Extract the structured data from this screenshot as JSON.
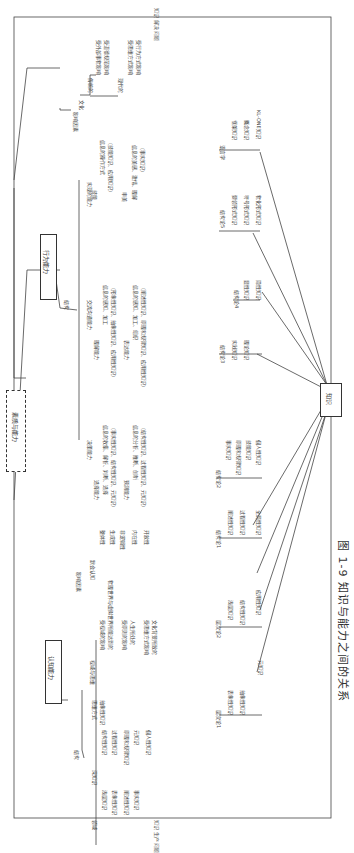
{
  "caption": "图 1-9  知识与能力之间的关系",
  "center_box": "素质与能力",
  "knowledge_box": "知识",
  "side_labels": {
    "top": "知识 解决 问题",
    "bottom": "知识 生产 问题"
  },
  "behavior": {
    "title": "行为能力",
    "structure": "结构",
    "influence": "影响因素",
    "culture": "文化",
    "traditional": "传统的",
    "trad_items": [
      "受外部事物影响",
      "受道德规范影响"
    ],
    "modern": "现代的",
    "modern_items": [
      "受思维方式影响",
      "受行为方式影响"
    ],
    "realize": "实现的能力",
    "skill": "技能",
    "skill_item": [
      "信息的操作方式",
      "（技能知识、应用知识）"
    ],
    "art": "审美",
    "art_item": [
      "信息的美感、激情、理解",
      "（事实知识）"
    ],
    "communicate": "交流沟通能力",
    "understand": "理解能力",
    "understand_item": [
      "信息的感知、加工",
      "（形象性知识、抽象性知识、应用性知识）"
    ],
    "express": "表达能力",
    "express_item": [
      "信息的感知、加工、组织",
      "（阐述性知识、原理和规律知识、应用性知识）"
    ],
    "decide": "决策能力",
    "choose": "选择能力",
    "choose_item": [
      "信息的收集、解析、判断、选择",
      "（事实性知识、结构性知识、元知识）"
    ],
    "predict": "预测能力",
    "predict_item": [
      "信息的分析、推断、创新",
      "（结构性知识、过程性知识、元知识）"
    ]
  },
  "cognitive": {
    "title": "认知能力",
    "structure": "结构",
    "domain": "领域",
    "domain_items": [
      "浅层知识",
      "表象性知识",
      "阐述性知识",
      "事实知识"
    ],
    "deep": "深知识",
    "deep_items": [
      "结构性知识",
      "过程性知识",
      "原理和规律知识",
      "元知识",
      "個人性知识"
    ],
    "thinking": "思维方式",
    "thinking_items": [
      "抽象性知识"
    ],
    "influence": "影响因素",
    "vision": "视域与思维",
    "vision_items": [
      "受视域的影响",
      "物理世界与虚拟世界所能达到的",
      "受原则的影响",
      "人生所处的",
      "受思维方式影响",
      "文化背景所致的"
    ],
    "cog_understand": "默会认知",
    "cog_items": [
      "整体性",
      "生成性",
      "非逻辑性",
      "内在性",
      "开放性"
    ]
  },
  "knowledge_groups": [
    {
      "title": "层次论1",
      "items": [
        "表象性知识",
        "抽象性知识",
        "元知识"
      ]
    },
    {
      "title": "层次论2",
      "items": [
        "浅层知识",
        "结构性知识",
        "应用性知识"
      ]
    },
    {
      "title": "结构论1",
      "items": [
        "阐述性知识",
        "过程性知识",
        "全局性知识"
      ]
    },
    {
      "title": "结构论2",
      "items": [
        "事实知识",
        "原理和规律知识",
        "技能知识",
        "個人性知识"
      ]
    },
    {
      "title": "结构论3",
      "items": [
        "实践知识",
        "理论知识"
      ]
    },
    {
      "title": "结构论4",
      "items": [
        "显性知识",
        "隐性知识"
      ]
    },
    {
      "title": "结构论5",
      "items": [
        "要领形式知识",
        "符号形式知识",
        "物化形式知识"
      ]
    },
    {
      "title": "语言学",
      "items": [
        "框架知识",
        "概念知识",
        "KL-ONE知识"
      ]
    }
  ]
}
